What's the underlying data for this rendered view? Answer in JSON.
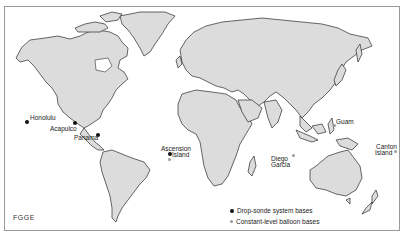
{
  "map": {
    "title_tag": "FGGE",
    "colors": {
      "land": "#dcdcdc",
      "coast": "#2a2a2a",
      "ocean": "#ffffff",
      "dropsonde": "#111111",
      "balloon": "#9a9a9a"
    },
    "stations": [
      {
        "name": "Honolulu",
        "type": "drop-sonde"
      },
      {
        "name": "Acapulco",
        "type": "drop-sonde"
      },
      {
        "name": "Panama",
        "type": "drop-sonde"
      },
      {
        "name_line1": "Ascension",
        "name_line2": "Island",
        "type": "drop-sonde+balloon"
      },
      {
        "name_line1": "Diego",
        "name_line2": "Garcia",
        "type": "balloon"
      },
      {
        "name": "Guam",
        "type": "balloon"
      },
      {
        "name_line1": "Canton",
        "name_line2": "Island",
        "type": "balloon"
      }
    ]
  },
  "legend": {
    "items": [
      {
        "label": "Drop-sonde system bases",
        "symbol": "black-dot"
      },
      {
        "label": "Constant-level balloon bases",
        "symbol": "gray-dot"
      }
    ]
  }
}
